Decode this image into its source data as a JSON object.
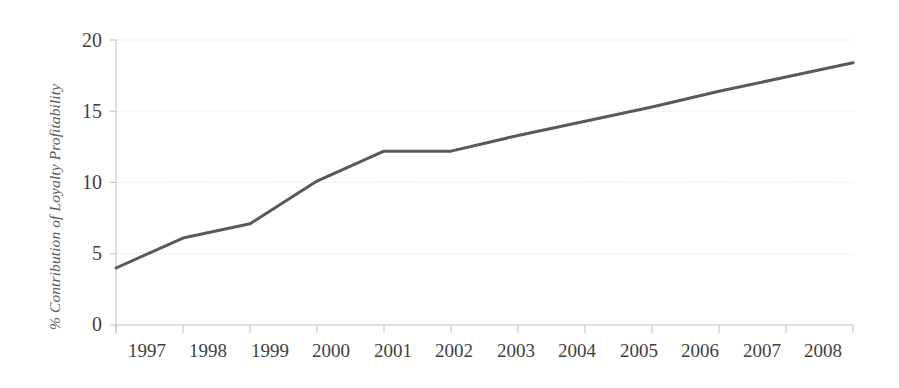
{
  "chart_data": {
    "type": "line",
    "title": "",
    "xlabel": "",
    "ylabel": "% Contribution of Loyalty Profitability",
    "categories": [
      "1997",
      "1998",
      "1999",
      "2000",
      "2001",
      "2002",
      "2003",
      "2004",
      "2005",
      "2006",
      "2007",
      "2008"
    ],
    "values": [
      4.0,
      6.1,
      7.1,
      10.1,
      12.2,
      12.2,
      13.3,
      14.3,
      15.3,
      16.4,
      17.4,
      18.4
    ],
    "series": [
      {
        "name": "% Contribution of Loyalty Profitability",
        "values": [
          4.0,
          6.1,
          7.1,
          10.1,
          12.2,
          12.2,
          13.3,
          14.3,
          15.3,
          16.4,
          17.4,
          18.4
        ]
      }
    ],
    "ylim": [
      0,
      20
    ],
    "yticks": [
      0,
      5,
      10,
      15,
      20
    ],
    "ytick_labels": [
      "0",
      "5",
      "10",
      "15",
      "20"
    ],
    "grid": true,
    "grid_axis": "y",
    "legend": "none",
    "line_color": "#595959",
    "grid_color": "#d9d9d9",
    "axis_color": "#bfbfbf",
    "background_color": "#ffffff",
    "text_color": "#3f3f3f"
  },
  "axes": {
    "y_title": "% Contribution of Loyalty Profitability",
    "y_tick_labels": [
      "20",
      "15",
      "10",
      "5",
      "0"
    ],
    "x_tick_labels": [
      "1997",
      "1998",
      "1999",
      "2000",
      "2001",
      "2002",
      "2003",
      "2004",
      "2005",
      "2006",
      "2007",
      "2008"
    ]
  }
}
